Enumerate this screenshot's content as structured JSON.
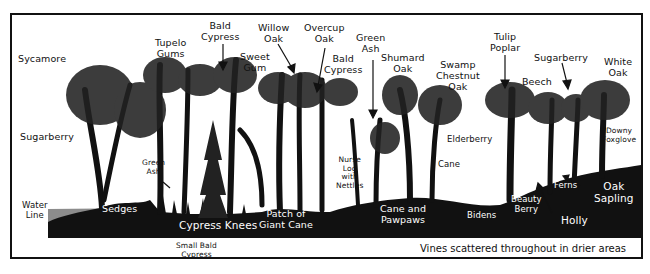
{
  "diagram": {
    "type": "forest-cross-section",
    "colors": {
      "ink": "#111111",
      "paper": "#ffffff",
      "water": "#8c8c8c"
    },
    "tree_labels": [
      {
        "id": "sycamore",
        "text": "Sycamore"
      },
      {
        "id": "tupelo-gums",
        "text": "Tupelo\nGums"
      },
      {
        "id": "bald-cypress-1",
        "text": "Bald\nCypress"
      },
      {
        "id": "sweet-gum",
        "text": "Sweet\nGum"
      },
      {
        "id": "willow-oak",
        "text": "Willow\nOak"
      },
      {
        "id": "overcup-oak",
        "text": "Overcup\nOak"
      },
      {
        "id": "bald-cypress-2",
        "text": "Bald\nCypress"
      },
      {
        "id": "green-ash-top",
        "text": "Green\nAsh"
      },
      {
        "id": "shumard-oak",
        "text": "Shumard\nOak"
      },
      {
        "id": "swamp-chestnut-oak",
        "text": "Swamp\nChestnut\nOak"
      },
      {
        "id": "tulip-poplar",
        "text": "Tulip\nPoplar"
      },
      {
        "id": "beech",
        "text": "Beech"
      },
      {
        "id": "sugarberry-right",
        "text": "Sugarberry"
      },
      {
        "id": "white-oak",
        "text": "White\nOak"
      }
    ],
    "understory_labels": [
      {
        "id": "sugarberry-left",
        "text": "Sugarberry"
      },
      {
        "id": "green-ash-small",
        "text": "Green\nAsh"
      },
      {
        "id": "nurse-log",
        "text": "Nurse\nLog\nwith\nNettles"
      },
      {
        "id": "elderberry",
        "text": "Elderberry"
      },
      {
        "id": "cane",
        "text": "Cane"
      },
      {
        "id": "downy-foxglove",
        "text": "Downy\nFoxglove"
      },
      {
        "id": "water-line",
        "text": "Water\nLine"
      },
      {
        "id": "small-bald-cypress",
        "text": "Small Bald\nCypress"
      }
    ],
    "ground_labels": [
      {
        "id": "sedges",
        "text": "Sedges"
      },
      {
        "id": "cypress-knees",
        "text": "Cypress Knees"
      },
      {
        "id": "giant-cane",
        "text": "Patch of\nGiant Cane"
      },
      {
        "id": "cane-pawpaws",
        "text": "Cane and\nPawpaws"
      },
      {
        "id": "bidens",
        "text": "Bidens"
      },
      {
        "id": "beauty-berry",
        "text": "Beauty\nBerry"
      },
      {
        "id": "ferns",
        "text": "Ferns"
      },
      {
        "id": "holly",
        "text": "Holly"
      },
      {
        "id": "oak-sapling",
        "text": "Oak\nSapling"
      }
    ],
    "caption": "Vines scattered throughout in drier areas"
  }
}
